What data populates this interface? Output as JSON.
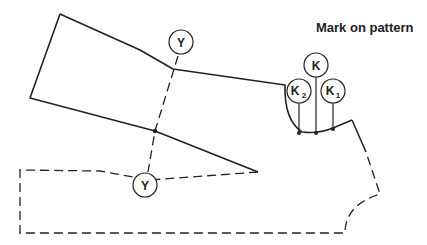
{
  "title": "Mark on pattern",
  "labels": {
    "y_top": "Y",
    "y_bottom": "Y",
    "k": "K",
    "k2_main": "K",
    "k2_sub": "2",
    "k1_main": "K",
    "k1_sub": "1"
  },
  "colors": {
    "line": "#222222",
    "background": "#ffffff"
  }
}
